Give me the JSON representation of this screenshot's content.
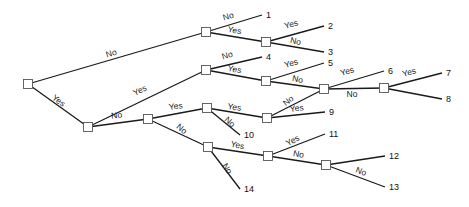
{
  "diagram": {
    "type": "decision-tree",
    "nodes": [
      {
        "id": "root",
        "x": 28,
        "y": 84
      },
      {
        "id": "A",
        "x": 206,
        "y": 32
      },
      {
        "id": "B",
        "x": 266,
        "y": 42
      },
      {
        "id": "C",
        "x": 88,
        "y": 127
      },
      {
        "id": "D",
        "x": 206,
        "y": 70
      },
      {
        "id": "E",
        "x": 266,
        "y": 81
      },
      {
        "id": "F",
        "x": 324,
        "y": 89
      },
      {
        "id": "G",
        "x": 384,
        "y": 88
      },
      {
        "id": "H",
        "x": 148,
        "y": 119
      },
      {
        "id": "I",
        "x": 207,
        "y": 108
      },
      {
        "id": "J",
        "x": 267,
        "y": 118
      },
      {
        "id": "K",
        "x": 208,
        "y": 147
      },
      {
        "id": "L",
        "x": 268,
        "y": 156
      },
      {
        "id": "M",
        "x": 326,
        "y": 165
      }
    ],
    "edges": [
      {
        "from": "root",
        "to": "A",
        "label": "No",
        "lx": 112,
        "ly": 56,
        "rot": -16
      },
      {
        "from": "root",
        "to": "C",
        "label": "Yes",
        "lx": 57,
        "ly": 103,
        "rot": 37
      },
      {
        "from": "A",
        "to": "leaf1",
        "label": "No",
        "lx": 229,
        "ly": 19,
        "rot": -16
      },
      {
        "from": "A",
        "to": "B",
        "label": "Yes",
        "lx": 234,
        "ly": 33,
        "rot": 10
      },
      {
        "from": "B",
        "to": "leaf2",
        "label": "Yes",
        "lx": 292,
        "ly": 27,
        "rot": -16
      },
      {
        "from": "B",
        "to": "leaf3",
        "label": "No",
        "lx": 295,
        "ly": 44,
        "rot": 12
      },
      {
        "from": "C",
        "to": "D",
        "label": "Yes",
        "lx": 141,
        "ly": 93,
        "rot": -25
      },
      {
        "from": "C",
        "to": "H",
        "label": "No",
        "lx": 117,
        "ly": 118,
        "rot": -7
      },
      {
        "from": "D",
        "to": "leaf4",
        "label": "No",
        "lx": 228,
        "ly": 58,
        "rot": -16
      },
      {
        "from": "D",
        "to": "E",
        "label": "Yes",
        "lx": 234,
        "ly": 72,
        "rot": 10
      },
      {
        "from": "E",
        "to": "leaf5",
        "label": "Yes",
        "lx": 292,
        "ly": 66,
        "rot": -16
      },
      {
        "from": "E",
        "to": "F",
        "label": "No",
        "lx": 297,
        "ly": 82,
        "rot": 12
      },
      {
        "from": "F",
        "to": "leaf6",
        "label": "Yes",
        "lx": 348,
        "ly": 74,
        "rot": -16
      },
      {
        "from": "F",
        "to": "G",
        "label": "No",
        "lx": 352,
        "ly": 97,
        "rot": 0
      },
      {
        "from": "G",
        "to": "leaf7",
        "label": "Yes",
        "lx": 410,
        "ly": 75,
        "rot": -16
      },
      {
        "from": "G",
        "to": "leaf8",
        "label": "",
        "lx": 0,
        "ly": 0,
        "rot": 0
      },
      {
        "from": "H",
        "to": "I",
        "label": "Yes",
        "lx": 176,
        "ly": 109,
        "rot": -8
      },
      {
        "from": "H",
        "to": "K",
        "label": "No",
        "lx": 180,
        "ly": 131,
        "rot": 40
      },
      {
        "from": "I",
        "to": "J",
        "label": "Yes",
        "lx": 234,
        "ly": 110,
        "rot": 8
      },
      {
        "from": "I",
        "to": "leaf10",
        "label": "No",
        "lx": 228,
        "ly": 124,
        "rot": 42
      },
      {
        "from": "J",
        "to": "F",
        "label": "No",
        "lx": 290,
        "ly": 103,
        "rot": -38
      },
      {
        "from": "J",
        "to": "leaf9",
        "label": "Yes",
        "lx": 297,
        "ly": 111,
        "rot": -8
      },
      {
        "from": "K",
        "to": "L",
        "label": "Yes",
        "lx": 237,
        "ly": 148,
        "rot": 12
      },
      {
        "from": "K",
        "to": "leaf14",
        "label": "No",
        "lx": 225,
        "ly": 170,
        "rot": 58
      },
      {
        "from": "L",
        "to": "leaf11",
        "label": "Yes",
        "lx": 294,
        "ly": 143,
        "rot": -28
      },
      {
        "from": "L",
        "to": "M",
        "label": "No",
        "lx": 298,
        "ly": 157,
        "rot": 10
      },
      {
        "from": "M",
        "to": "leaf12",
        "label": "",
        "lx": 0,
        "ly": 0,
        "rot": 0
      },
      {
        "from": "M",
        "to": "leaf13",
        "label": "No",
        "lx": 360,
        "ly": 174,
        "rot": 22
      }
    ],
    "leaves": [
      {
        "id": "leaf1",
        "label": "1",
        "x": 262,
        "y": 15
      },
      {
        "id": "leaf2",
        "label": "2",
        "x": 324,
        "y": 26
      },
      {
        "id": "leaf3",
        "label": "3",
        "x": 324,
        "y": 52
      },
      {
        "id": "leaf4",
        "label": "4",
        "x": 262,
        "y": 57
      },
      {
        "id": "leaf5",
        "label": "5",
        "x": 324,
        "y": 63
      },
      {
        "id": "leaf6",
        "label": "6",
        "x": 384,
        "y": 71
      },
      {
        "id": "leaf7",
        "label": "7",
        "x": 442,
        "y": 73
      },
      {
        "id": "leaf8",
        "label": "8",
        "x": 442,
        "y": 99
      },
      {
        "id": "leaf9",
        "label": "9",
        "x": 325,
        "y": 112
      },
      {
        "id": "leaf10",
        "label": "10",
        "x": 240,
        "y": 135
      },
      {
        "id": "leaf11",
        "label": "11",
        "x": 325,
        "y": 134
      },
      {
        "id": "leaf12",
        "label": "12",
        "x": 385,
        "y": 156
      },
      {
        "id": "leaf13",
        "label": "13",
        "x": 385,
        "y": 187
      },
      {
        "id": "leaf14",
        "label": "14",
        "x": 240,
        "y": 189
      }
    ]
  }
}
